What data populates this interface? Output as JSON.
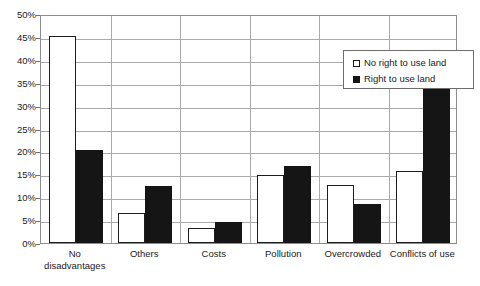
{
  "chart_data": {
    "type": "bar",
    "title": "",
    "xlabel": "",
    "ylabel": "",
    "ylim": [
      0,
      50
    ],
    "ytick_labels": [
      "50%",
      "45%",
      "40%",
      "35%",
      "30%",
      "25%",
      "20%",
      "15%",
      "10%",
      "5%",
      "0%"
    ],
    "ytick_values": [
      50,
      45,
      40,
      35,
      30,
      25,
      20,
      15,
      10,
      5,
      0
    ],
    "grid": "horizontal-and-category-separators",
    "legend_position": "upper-right-inside",
    "categories": [
      "No disadvantages",
      "Others",
      "Costs",
      "Pollution",
      "Overcrowded",
      "Conflicts of use"
    ],
    "series": [
      {
        "name": "No right to use land",
        "style": "white-filled-black-outline",
        "color": "#ffffff",
        "values": [
          45.3,
          6.6,
          3.2,
          14.8,
          12.6,
          15.8
        ]
      },
      {
        "name": "Right to use land",
        "style": "black-filled",
        "color": "#151515",
        "values": [
          20.2,
          12.4,
          4.5,
          16.9,
          8.6,
          35.2
        ]
      }
    ]
  },
  "legend": {
    "items": [
      {
        "label": "No right to use land",
        "swatch": "open-square-icon"
      },
      {
        "label": "Right to use land",
        "swatch": "filled-square-icon"
      }
    ]
  },
  "axes": {
    "y": {
      "ticks": [
        "50%",
        "45%",
        "40%",
        "35%",
        "30%",
        "25%",
        "20%",
        "15%",
        "10%",
        "5%",
        "0%"
      ]
    },
    "x": {
      "categories": [
        {
          "line1": "No",
          "line2": "disadvantages"
        },
        {
          "line1": "Others",
          "line2": ""
        },
        {
          "line1": "Costs",
          "line2": ""
        },
        {
          "line1": "Pollution",
          "line2": ""
        },
        {
          "line1": "Overcrowded",
          "line2": ""
        },
        {
          "line1": "Conflicts of use",
          "line2": ""
        }
      ]
    }
  },
  "title_ghost": ""
}
